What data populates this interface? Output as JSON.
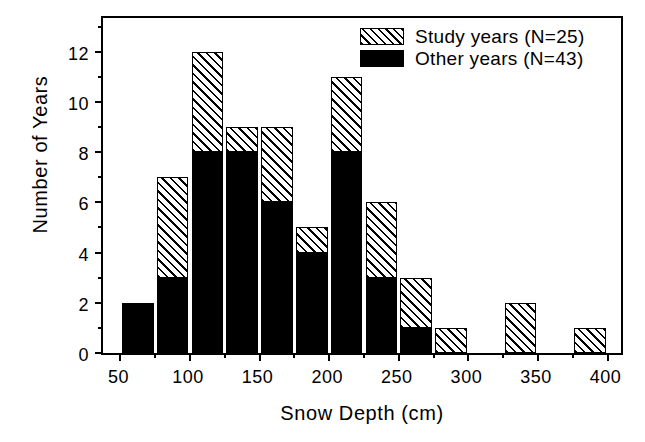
{
  "chart_data": {
    "type": "bar",
    "title": "",
    "subtitle": "",
    "xlabel": "Snow Depth (cm)",
    "ylabel": "Number of Years",
    "xlim": [
      37.5,
      412.5
    ],
    "ylim": [
      0,
      13.5
    ],
    "xticks": [
      50,
      100,
      150,
      200,
      250,
      300,
      350,
      400
    ],
    "xtick_labels": [
      "50",
      "100",
      "150",
      "200",
      "250",
      "300",
      "350",
      "400"
    ],
    "yticks": [
      0,
      2,
      4,
      6,
      8,
      10,
      12
    ],
    "ytick_labels": [
      "0",
      "2",
      "4",
      "6",
      "8",
      "10",
      "12"
    ],
    "x_minor_tick_step": 25,
    "y_minor_tick_step": 1,
    "grid": false,
    "bin_width": 25,
    "stacked": true,
    "legend_position": "top-right",
    "categories": [
      "50-75",
      "75-100",
      "100-125",
      "125-150",
      "150-175",
      "175-200",
      "200-225",
      "225-250",
      "250-275",
      "275-300",
      "300-325",
      "325-350",
      "350-375",
      "375-400"
    ],
    "bin_starts": [
      50,
      75,
      100,
      125,
      150,
      175,
      200,
      225,
      250,
      275,
      300,
      325,
      350,
      375
    ],
    "series": [
      {
        "name": "Other years (N=43)",
        "fill": "solid-black",
        "color": "#000000",
        "values": [
          2,
          3,
          8,
          8,
          6,
          4,
          8,
          3,
          1,
          0,
          0,
          0,
          0,
          0
        ]
      },
      {
        "name": "Study years (N=25)",
        "fill": "hatched",
        "color": "#ffffff",
        "values": [
          0,
          4,
          4,
          1,
          3,
          1,
          3,
          3,
          2,
          1,
          0,
          2,
          0,
          1
        ]
      }
    ],
    "totals": [
      2,
      7,
      12,
      9,
      9,
      5,
      11,
      6,
      3,
      1,
      0,
      2,
      0,
      1
    ]
  },
  "legend": {
    "entries": [
      {
        "label": "Study years (N=25)",
        "swatch": "hatched"
      },
      {
        "label": "Other years (N=43)",
        "swatch": "solid"
      }
    ]
  },
  "axes": {
    "x_title": "Snow Depth (cm)",
    "y_title": "Number of Years"
  },
  "colors": {
    "foreground": "#000000",
    "background": "#ffffff"
  }
}
